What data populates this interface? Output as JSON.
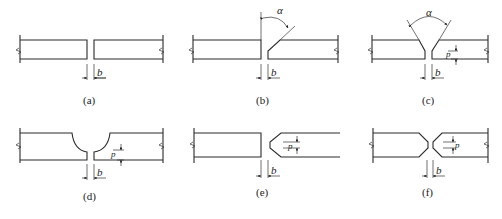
{
  "figure": {
    "panels": [
      {
        "id": "a",
        "label": "(a)",
        "type": "square-groove",
        "symbols": [
          "b"
        ]
      },
      {
        "id": "b",
        "label": "(b)",
        "type": "single-bevel-groove",
        "symbols": [
          "α",
          "b"
        ]
      },
      {
        "id": "c",
        "label": "(c)",
        "type": "V-groove",
        "symbols": [
          "α",
          "p",
          "b"
        ]
      },
      {
        "id": "d",
        "label": "(d)",
        "type": "U-groove",
        "symbols": [
          "p",
          "b"
        ]
      },
      {
        "id": "e",
        "label": "(e)",
        "type": "K-groove (single side)",
        "symbols": [
          "p",
          "b"
        ]
      },
      {
        "id": "f",
        "label": "(f)",
        "type": "X-groove (double-V)",
        "symbols": [
          "p",
          "b"
        ]
      }
    ],
    "symbols": {
      "gap": "b",
      "angle": "α",
      "root_face": "p"
    }
  }
}
